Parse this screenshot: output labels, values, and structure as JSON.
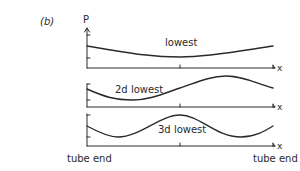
{
  "figure": {
    "panel_label": "(b)",
    "y_axis_label": "P",
    "x_axis_label": "x",
    "left_end_label": "tube end",
    "right_end_label": "tube end",
    "panels": [
      {
        "label": "lowest",
        "description": "half-cosine: high at left, min at middle, high at right"
      },
      {
        "label": "2d lowest",
        "description": "full cosine period: high, low, high"
      },
      {
        "label": "3d lowest",
        "description": "1.5 cosine periods: high, low, high, low"
      }
    ],
    "colors": {
      "ink": "#2a2a2a",
      "background": "#ffffff"
    }
  }
}
